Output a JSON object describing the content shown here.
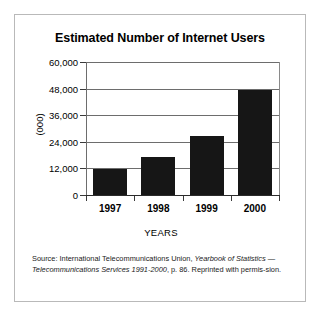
{
  "figure": {
    "title": "Estimated Number of Internet Users",
    "x_axis_title": "YEARS",
    "y_axis_title": "(000)"
  },
  "source_note": {
    "line1_plain": "Source: International Telecommunications Union, ",
    "line1_italic": "Yearbook of Statistics",
    "line2_italic": "— Telecommunications Services 1991-2000",
    "line2_plain": ", p. 86. Reprinted with permis-",
    "line3_plain": "sion."
  },
  "chart_data": {
    "type": "bar",
    "title": "Estimated Number of Internet Users",
    "xlabel": "YEARS",
    "ylabel": "(000)",
    "categories": [
      "1997",
      "1998",
      "1999",
      "2000"
    ],
    "values": [
      11800,
      17200,
      26500,
      47500
    ],
    "ylim": [
      0,
      60000
    ],
    "yticks": [
      0,
      12000,
      24000,
      36000,
      48000,
      60000
    ],
    "ytick_labels": [
      "0",
      "12,000",
      "24,000",
      "36,000",
      "48,000",
      "60,000"
    ],
    "grid": true,
    "legend": false,
    "bar_color": "#161616",
    "axis_color": "#6d6d6d"
  }
}
